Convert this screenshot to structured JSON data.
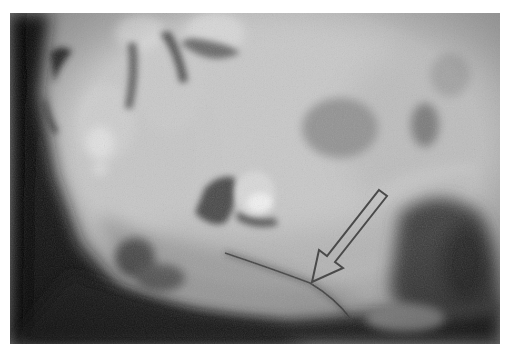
{
  "image": {
    "kind": "radiograph",
    "subject": "mandible / jaw region, lateral view",
    "colors": {
      "background": "#ffffff",
      "bone_light": "#cfcfcf",
      "tissue_mid": "#a6a6a6",
      "shadow_dark": "#1a1a1a",
      "arrow_stroke": "#4a4a4a"
    },
    "annotations": [
      {
        "type": "arrow",
        "style": "outlined",
        "direction": "down-left",
        "tail": [
          378,
          190
        ],
        "tip": [
          313,
          283
        ]
      }
    ]
  }
}
